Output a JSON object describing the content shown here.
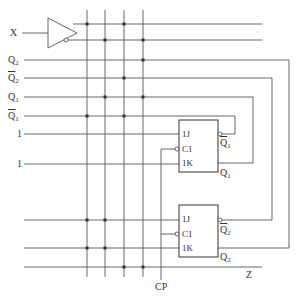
{
  "diagram": {
    "type": "sequential-logic-circuit",
    "input_labels": {
      "x": "X",
      "q2": "Q",
      "q2_sub": "2",
      "q2bar": "Q",
      "q2bar_sub": "2",
      "q1": "Q",
      "q1_sub": "1",
      "q1bar": "Q",
      "q1bar_sub": "1",
      "one_a": "1",
      "one_b": "1"
    },
    "flipflops": [
      {
        "name": "FF1",
        "pin_j": "1J",
        "pin_c": "C1",
        "pin_k": "1K",
        "out_qbar": "Q",
        "out_qbar_sub": "1",
        "out_q": "Q",
        "out_q_sub": "1"
      },
      {
        "name": "FF2",
        "pin_j": "1J",
        "pin_c": "C1",
        "pin_k": "1K",
        "out_qbar": "Q",
        "out_qbar_sub": "2",
        "out_q": "Q",
        "out_q_sub": "2"
      }
    ],
    "clock_label": "CP",
    "output_label": "Z",
    "colors": {
      "line": "#555555",
      "dot": "#333333",
      "background": "#ffffff"
    }
  }
}
